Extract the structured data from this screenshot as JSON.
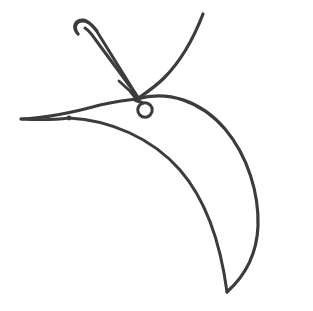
{
  "document": {
    "title": "Needle and Thread Line Drawing",
    "width": 313,
    "height": 311,
    "background_color": "#ffffff",
    "style": "monochrome contour line art"
  },
  "palette": {
    "stroke_color": "#3c3c3c",
    "background_color": "#ffffff"
  },
  "drawing": {
    "subject": "sewing needle piercing a curved sweeping shape with three tapering contour arcs",
    "stroke_width_main": 3.2,
    "stroke_width_thin": 2.6,
    "elements": [
      {
        "name": "needle-body",
        "label": "Needle Body",
        "description": "Elongated slender shaft with rounded cap at upper left and tapered point at lower right",
        "path": "M 78 34 C 73 27 76 21 83 21 C 88 21 92 25 96 30 L 137 96",
        "path_b": "M 137 96 L 95 39 C 91 33 88 30 85 28",
        "stroke_width": 3.0
      },
      {
        "name": "needle-cap",
        "label": "Needle Rounded Cap",
        "description": "U-shaped rounded end at top-left of the needle",
        "path": "M 78 34 C 71 26 76 19 84 20 C 89 21 93 26 97 31",
        "stroke_width": 3.0
      },
      {
        "name": "needle-taper-line",
        "label": "Needle Taper Line",
        "description": "Short diagonal line marking where the shaft narrows into the point",
        "path": "M 119 81 L 131 92",
        "stroke_width": 2.8
      },
      {
        "name": "needle-point",
        "label": "Needle Point",
        "description": "Sharp tip of needle meeting junction node",
        "path": "M 131 92 L 138 101",
        "stroke_width": 3.4
      },
      {
        "name": "eyelet-ring",
        "label": "Eyelet Ring",
        "description": "Small open circle hanging below the needle point",
        "center_x": 145,
        "center_y": 110,
        "radius": 7.2,
        "stroke_width": 3.0
      },
      {
        "name": "ring-connector",
        "label": "Ring Connector",
        "description": "Short stem connecting junction node to the eyelet ring",
        "path": "M 138 101 L 143 103",
        "stroke_width": 3.0
      },
      {
        "name": "junction-node",
        "label": "Junction Node",
        "description": "Dark thickened point where needle tip, outer curve and left tail meet",
        "center_x": 137,
        "center_y": 99,
        "radius": 3.4
      },
      {
        "name": "left-tail-node",
        "label": "Left Tail Node",
        "description": "Slight thickening where the two left tail lines cross",
        "center_x": 69,
        "center_y": 118,
        "radius": 2.4
      },
      {
        "name": "outer-arc",
        "label": "Outer Contour Arc",
        "description": "Large outermost curve from top cusp sweeping right and down to the bottom tail point",
        "path": "M 203 14 C 232 40 263 72 283 110 C 300 143 304 182 296 215 C 288 248 262 274 227 292",
        "stroke_width": 3.2
      },
      {
        "name": "cusp-left-arc",
        "label": "Cusp Left Arc",
        "description": "Curve descending from top cusp to the left toward the needle junction region",
        "path": "M 203 14 C 193 40 180 62 164 78 C 155 87 146 93 137 99",
        "stroke_width": 3.2
      },
      {
        "name": "middle-arc",
        "label": "Middle Contour Arc",
        "description": "Middle sweeping curve starting near the junction, bulging right then tapering to the bottom point",
        "path": "M 137 99 C 168 90 201 101 225 129 C 248 156 259 194 258 226 C 257 252 247 274 227 292",
        "stroke_width": 3.0
      },
      {
        "name": "inner-arc",
        "label": "Inner Contour Arc",
        "description": "Innermost curve from the left tail sweeping right and down to the bottom point",
        "path": "M 69 118 C 110 120 152 138 180 170 C 207 201 221 247 227 292",
        "stroke_width": 3.0
      },
      {
        "name": "left-tail-upper",
        "label": "Left Tail Upper Line",
        "description": "Upper line of the thin left tail running from the far-left point to the junction node",
        "path": "M 21 119 C 45 118 75 112 100 105 C 114 102 127 100 137 99",
        "stroke_width": 2.8
      },
      {
        "name": "left-tail-lower",
        "label": "Left Tail Lower Line",
        "description": "Lower line of the thin left tail running from the far-left point into the inner arc",
        "path": "M 21 119 C 38 120 54 120 69 118",
        "stroke_width": 2.8
      }
    ]
  }
}
